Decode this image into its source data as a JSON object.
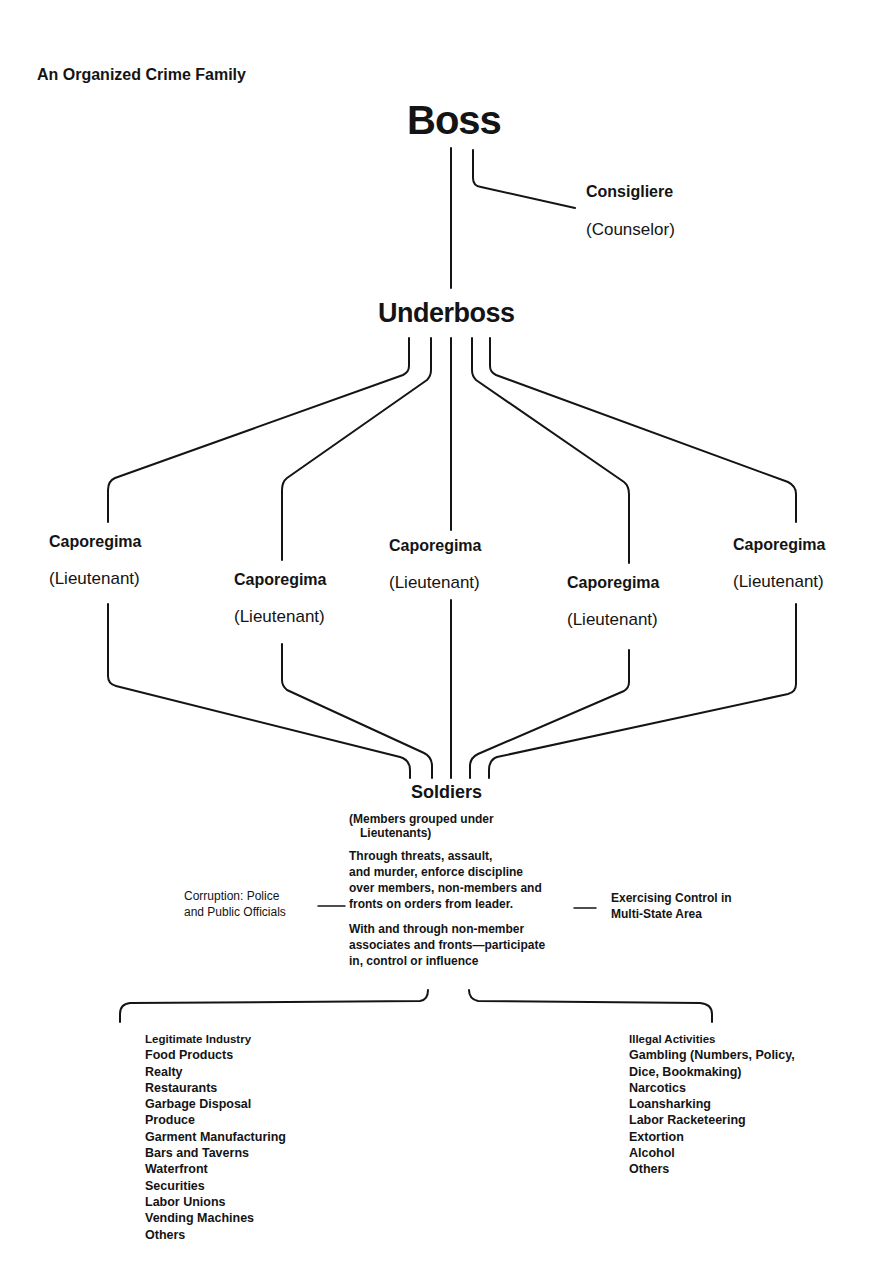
{
  "title": "An Organized Crime Family",
  "boss": {
    "label": "Boss"
  },
  "consigliere": {
    "label": "Consigliere",
    "sublabel": "(Counselor)"
  },
  "underboss": {
    "label": "Underboss"
  },
  "caporegimes": [
    {
      "label": "Caporegima",
      "sublabel": "(Lieutenant)"
    },
    {
      "label": "Caporegima",
      "sublabel": "(Lieutenant)"
    },
    {
      "label": "Caporegima",
      "sublabel": "(Lieutenant)"
    },
    {
      "label": "Caporegima",
      "sublabel": "(Lieutenant)"
    },
    {
      "label": "Caporegima",
      "sublabel": "(Lieutenant)"
    }
  ],
  "soldiers": {
    "label": "Soldiers",
    "note_lines": [
      "(Members grouped under",
      "Lieutenants)"
    ],
    "discipline_lines": [
      "Through threats, assault,",
      "and murder, enforce discipline",
      "over members, non-members and",
      "fronts on orders from leader."
    ],
    "associates_lines": [
      "With and through non-member",
      "associates and fronts—participate",
      "in, control or influence"
    ]
  },
  "side_notes": {
    "left_lines": [
      "Corruption: Police",
      "and Public Officials"
    ],
    "right_lines": [
      "Exercising Control in",
      "Multi-State Area"
    ]
  },
  "legitimate_industry": {
    "header": "Legitimate Industry",
    "items": [
      "Food Products",
      "Realty",
      "Restaurants",
      "Garbage Disposal",
      "Produce",
      "Garment Manufacturing",
      "Bars and Taverns",
      "Waterfront",
      "Securities",
      "Labor Unions",
      "Vending Machines",
      "Others"
    ]
  },
  "illegal_activities": {
    "header": "Illegal Activities",
    "items": [
      "Gambling (Numbers, Policy,",
      "Dice, Bookmaking)",
      "Narcotics",
      "Loansharking",
      "Labor Racketeering",
      "Extortion",
      "Alcohol",
      "Others"
    ]
  },
  "colors": {
    "ink": "#141414",
    "background": "#ffffff"
  }
}
